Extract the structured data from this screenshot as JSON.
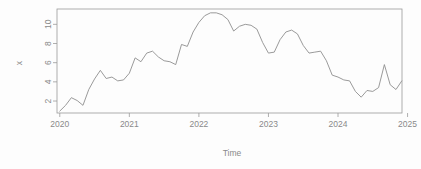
{
  "figure": {
    "background_color": "#fdfdfd",
    "frame_color": "#9a9a9a",
    "line_color": "#8f8f8f",
    "text_color": "#8a8a8a"
  },
  "chart_data": {
    "type": "line",
    "title": "",
    "xlabel": "Time",
    "ylabel": "x",
    "grid": false,
    "legend": false,
    "xlim": [
      2019.96,
      2024.92
    ],
    "ylim": [
      0.75,
      11.6
    ],
    "xticks": [
      2020,
      2021,
      2022,
      2023,
      2024,
      2025
    ],
    "xticklabels": [
      "2020",
      "2021",
      "2022",
      "2023",
      "2024",
      "2025"
    ],
    "yticks": [
      2,
      4,
      6,
      8,
      10
    ],
    "yticklabels": [
      "2",
      "4",
      "6",
      "8",
      "10"
    ],
    "series": [
      {
        "name": "x",
        "x": [
          2020.0,
          2020.0833,
          2020.1667,
          2020.25,
          2020.3333,
          2020.4167,
          2020.5,
          2020.5833,
          2020.6667,
          2020.75,
          2020.8333,
          2020.9167,
          2021.0,
          2021.0833,
          2021.1667,
          2021.25,
          2021.3333,
          2021.4167,
          2021.5,
          2021.5833,
          2021.6667,
          2021.75,
          2021.8333,
          2021.9167,
          2022.0,
          2022.0833,
          2022.1667,
          2022.25,
          2022.3333,
          2022.4167,
          2022.5,
          2022.5833,
          2022.6667,
          2022.75,
          2022.8333,
          2022.9167,
          2023.0,
          2023.0833,
          2023.1667,
          2023.25,
          2023.3333,
          2023.4167,
          2023.5,
          2023.5833,
          2023.6667,
          2023.75,
          2023.8333,
          2023.9167,
          2024.0,
          2024.0833,
          2024.1667,
          2024.25,
          2024.3333,
          2024.4167,
          2024.5,
          2024.5833,
          2024.6667,
          2024.75,
          2024.8333,
          2024.9167
        ],
        "values": [
          0.95,
          1.55,
          2.35,
          2.05,
          1.55,
          3.2,
          4.3,
          5.2,
          4.35,
          4.5,
          4.1,
          4.2,
          4.9,
          6.5,
          6.1,
          7.0,
          7.2,
          6.6,
          6.2,
          6.1,
          5.8,
          7.9,
          7.7,
          9.2,
          10.2,
          10.9,
          11.2,
          11.2,
          11.0,
          10.5,
          9.3,
          9.8,
          10.0,
          9.9,
          9.5,
          8.1,
          7.0,
          7.1,
          8.4,
          9.2,
          9.4,
          9.0,
          7.8,
          7.0,
          7.1,
          7.2,
          6.2,
          4.7,
          4.5,
          4.2,
          4.1,
          3.0,
          2.4,
          3.1,
          3.0,
          3.4,
          5.8,
          3.7,
          3.2,
          4.1
        ]
      }
    ]
  }
}
